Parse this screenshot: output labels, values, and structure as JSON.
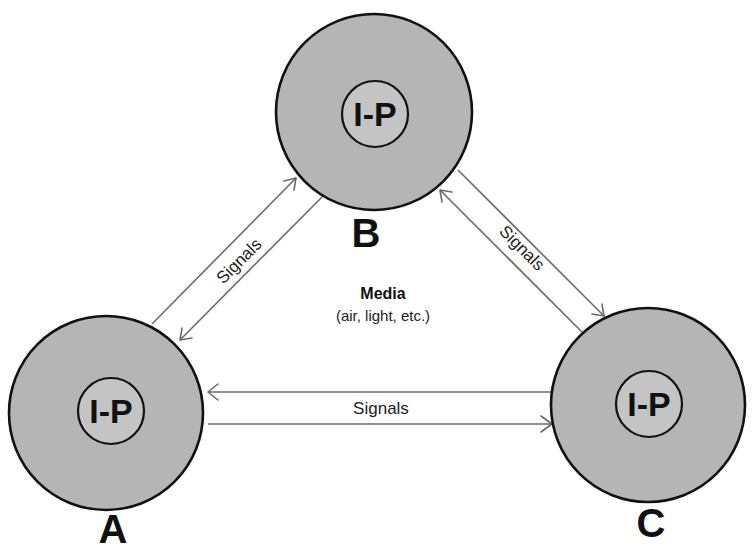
{
  "diagram": {
    "nodes": [
      {
        "id": "A",
        "letter": "A",
        "inner_label": "I-P"
      },
      {
        "id": "B",
        "letter": "B",
        "inner_label": "I-P"
      },
      {
        "id": "C",
        "letter": "C",
        "inner_label": "I-P"
      }
    ],
    "links": [
      {
        "from": "A",
        "to": "B",
        "label": "Signals",
        "bidirectional": true
      },
      {
        "from": "B",
        "to": "C",
        "label": "Signals",
        "bidirectional": true
      },
      {
        "from": "A",
        "to": "C",
        "label": "Signals",
        "bidirectional": true
      }
    ],
    "medium": {
      "title": "Media",
      "subtitle": "(air, light, etc.)"
    },
    "colors": {
      "node_fill": "#b5b5b5",
      "inner_fill": "#c4c4c4",
      "outline": "#111111",
      "arrow": "#6a6a6a"
    }
  }
}
